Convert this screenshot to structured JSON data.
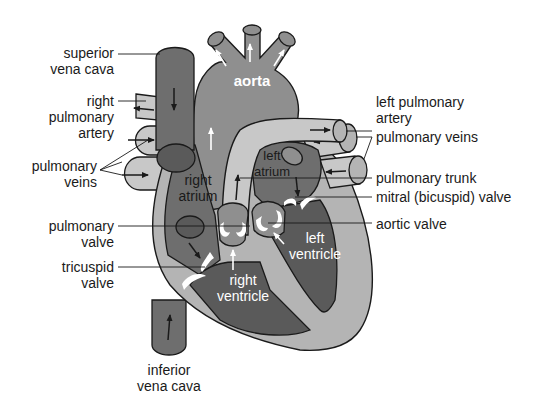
{
  "diagram": {
    "colors": {
      "deoxygenated_dark": "#6e6e6e",
      "chamber_dark": "#5a5a5a",
      "aorta_mid": "#8f8f8f",
      "muscle_light": "#b4b4b4",
      "vessel_light": "#c8c8c8",
      "outline": "#1a1a1a",
      "valve_white": "#ffffff"
    },
    "labels_left": [
      {
        "id": "superior-vena-cava",
        "lines": [
          "superior",
          "vena cava"
        ]
      },
      {
        "id": "right-pulmonary-artery",
        "lines": [
          "right",
          "pulmonary",
          "artery"
        ]
      },
      {
        "id": "pulmonary-veins-left",
        "lines": [
          "pulmonary",
          "veins"
        ]
      },
      {
        "id": "pulmonary-valve",
        "lines": [
          "pulmonary",
          "valve"
        ]
      },
      {
        "id": "tricuspid-valve",
        "lines": [
          "tricuspid",
          "valve"
        ]
      }
    ],
    "labels_right": [
      {
        "id": "left-pulmonary-artery",
        "lines": [
          "left pulmonary",
          "artery"
        ]
      },
      {
        "id": "pulmonary-veins-right",
        "lines": [
          "pulmonary veins"
        ]
      },
      {
        "id": "pulmonary-trunk",
        "lines": [
          "pulmonary trunk"
        ]
      },
      {
        "id": "mitral-valve",
        "lines": [
          "mitral (bicuspid) valve"
        ]
      },
      {
        "id": "aortic-valve",
        "lines": [
          "aortic valve"
        ]
      }
    ],
    "labels_bottom": [
      {
        "id": "inferior-vena-cava",
        "lines": [
          "inferior",
          "vena cava"
        ]
      }
    ],
    "labels_inside": [
      {
        "id": "aorta",
        "lines": [
          "aorta"
        ]
      },
      {
        "id": "right-atrium",
        "lines": [
          "right",
          "atrium"
        ]
      },
      {
        "id": "left-atrium",
        "lines": [
          "left",
          "atrium"
        ]
      },
      {
        "id": "right-ventricle",
        "lines": [
          "right",
          "ventricle"
        ]
      },
      {
        "id": "left-ventricle",
        "lines": [
          "left",
          "ventricle"
        ]
      }
    ]
  }
}
